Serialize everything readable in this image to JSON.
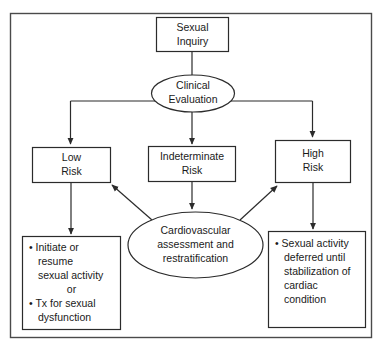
{
  "diagram": {
    "frame": {
      "label": "outer-border"
    },
    "colors": {
      "background": "#ffffff",
      "shape_fill": "#ffffff",
      "shape_stroke": "#2b2b2b",
      "frame_stroke": "#4a4a4a",
      "text": "#1a1a1a"
    },
    "nodes": {
      "sexual_inquiry": {
        "shape": "rectangle",
        "lines": [
          "Sexual",
          "Inquiry"
        ]
      },
      "clinical_evaluation": {
        "shape": "ellipse",
        "lines": [
          "Clinical",
          "Evaluation"
        ]
      },
      "low_risk": {
        "shape": "rectangle",
        "lines": [
          "Low",
          "Risk"
        ]
      },
      "indeterminate_risk": {
        "shape": "rectangle",
        "lines": [
          "Indeterminate",
          "Risk"
        ]
      },
      "high_risk": {
        "shape": "rectangle",
        "lines": [
          "High",
          "Risk"
        ]
      },
      "cardiovascular_assessment": {
        "shape": "ellipse",
        "lines": [
          "Cardiovascular",
          "assessment and",
          "restratification"
        ]
      },
      "low_risk_outcome": {
        "shape": "rectangle",
        "lines": [
          "• Initiate or",
          "resume",
          "sexual activity",
          "or",
          "• Tx for sexual",
          "dysfunction"
        ]
      },
      "high_risk_outcome": {
        "shape": "rectangle",
        "lines": [
          "• Sexual activity",
          "deferred until",
          "stabilization of",
          "cardiac",
          "condition"
        ]
      }
    },
    "edges": [
      {
        "name": "inquiry-to-evaluation",
        "from": "sexual_inquiry",
        "to": "clinical_evaluation",
        "style": "line"
      },
      {
        "name": "evaluation-to-low-risk",
        "from": "clinical_evaluation",
        "to": "low_risk",
        "style": "elbow-arrow"
      },
      {
        "name": "evaluation-to-indeterminate-risk",
        "from": "clinical_evaluation",
        "to": "indeterminate_risk",
        "style": "arrow"
      },
      {
        "name": "evaluation-to-high-risk",
        "from": "clinical_evaluation",
        "to": "high_risk",
        "style": "elbow-arrow"
      },
      {
        "name": "indeterminate-risk-to-cardiovascular",
        "from": "indeterminate_risk",
        "to": "cardiovascular_assessment",
        "style": "arrow"
      },
      {
        "name": "cardiovascular-to-low-risk",
        "from": "cardiovascular_assessment",
        "to": "low_risk",
        "style": "diagonal-arrow"
      },
      {
        "name": "cardiovascular-to-high-risk",
        "from": "cardiovascular_assessment",
        "to": "high_risk",
        "style": "diagonal-arrow"
      },
      {
        "name": "low-risk-to-outcome",
        "from": "low_risk",
        "to": "low_risk_outcome",
        "style": "arrow"
      },
      {
        "name": "high-risk-to-outcome",
        "from": "high_risk",
        "to": "high_risk_outcome",
        "style": "arrow"
      }
    ]
  }
}
